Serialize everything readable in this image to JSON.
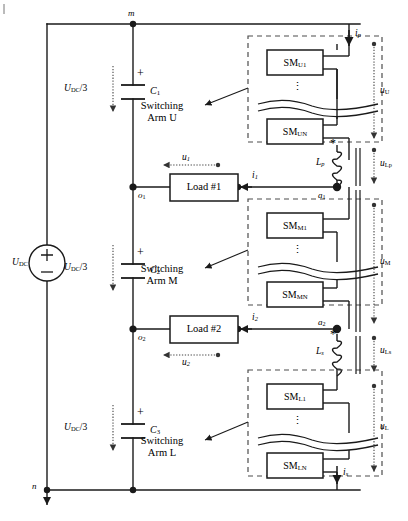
{
  "diagram": {
    "type": "circuit-schematic"
  },
  "source": {
    "label_main": "U",
    "label_sub": "DC",
    "plus": "+",
    "minus": "−"
  },
  "nodes": {
    "m": "m",
    "n": "n",
    "o1_main": "o",
    "o1_sub": "1",
    "o2_main": "o",
    "o2_sub": "2",
    "a1_main": "a",
    "a1_sub": "1",
    "a2_main": "a",
    "a2_sub": "2"
  },
  "capacitors": [
    {
      "name": "capacitor-c1",
      "label_main": "C",
      "label_sub": "1",
      "polarity": "+",
      "voltage_main": "U",
      "voltage_sub": "DC",
      "voltage_div": "/3"
    },
    {
      "name": "capacitor-c2",
      "label_main": "C",
      "label_sub": "2",
      "polarity": "+",
      "voltage_main": "U",
      "voltage_sub": "DC",
      "voltage_div": "/3"
    },
    {
      "name": "capacitor-c3",
      "label_main": "C",
      "label_sub": "3",
      "polarity": "+",
      "voltage_main": "U",
      "voltage_sub": "DC",
      "voltage_div": "/3"
    }
  ],
  "loads": [
    {
      "name": "load-1",
      "label": "Load #1",
      "current_main": "i",
      "current_sub": "1",
      "voltage_main": "u",
      "voltage_sub": "1"
    },
    {
      "name": "load-2",
      "label": "Load #2",
      "current_main": "i",
      "current_sub": "2",
      "voltage_main": "u",
      "voltage_sub": "2"
    }
  ],
  "arms": [
    {
      "name": "switching-arm-u",
      "caption_line1": "Switching",
      "caption_line2": "Arm U",
      "sm_top_main": "SM",
      "sm_top_sub": "U1",
      "sm_bottom_main": "SM",
      "sm_bottom_sub": "UN",
      "voltage_main": "u",
      "voltage_sub": "U"
    },
    {
      "name": "switching-arm-m",
      "caption_line1": "Switching",
      "caption_line2": "Arm M",
      "sm_top_main": "SM",
      "sm_top_sub": "M1",
      "sm_bottom_main": "SM",
      "sm_bottom_sub": "MN",
      "voltage_main": "u",
      "voltage_sub": "M"
    },
    {
      "name": "switching-arm-l",
      "caption_line1": "Switching",
      "caption_line2": "Arm L",
      "sm_top_main": "SM",
      "sm_top_sub": "L1",
      "sm_bottom_main": "SM",
      "sm_bottom_sub": "LN",
      "voltage_main": "u",
      "voltage_sub": "L"
    }
  ],
  "inductors": [
    {
      "name": "inductor-lp",
      "label_main": "L",
      "label_sub": "p",
      "dot": "*",
      "voltage_main": "u",
      "voltage_sub": "Lp"
    },
    {
      "name": "inductor-ls",
      "label_main": "L",
      "label_sub": "s",
      "dot": "*",
      "voltage_main": "u",
      "voltage_sub": "Ls"
    }
  ],
  "currents": [
    {
      "name": "current-ip",
      "label_main": "i",
      "label_sub": "p"
    },
    {
      "name": "current-is",
      "label_main": "i",
      "label_sub": "s"
    }
  ],
  "colors": {
    "wire": "#1a1a1a",
    "dashed": "#4d4d4d",
    "dotted": "#555555",
    "background": "#ffffff"
  },
  "ellipsis": "⋮"
}
